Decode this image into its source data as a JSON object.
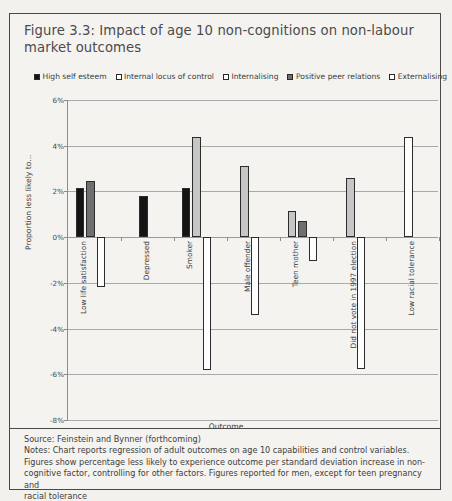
{
  "title": "Figure 3.3: Impact of age 10 non-cognitions on non-labour market outcomes",
  "legend": [
    {
      "label": "High self esteem",
      "color": "#141414",
      "swatch": "black-swatch"
    },
    {
      "label": "Internal locus of control",
      "color": "#ffffff",
      "swatch": "white-swatch"
    },
    {
      "label": "Internalising",
      "color": "#ffffff",
      "swatch": "white-swatch"
    },
    {
      "label": "Positive peer relations",
      "color": "#6f6f6f",
      "swatch": "gray-swatch"
    },
    {
      "label": "Externalising",
      "color": "#ffffff",
      "swatch": "white-swatch"
    }
  ],
  "footer": {
    "source": "Source: Feinstein and Bynner (forthcoming)",
    "notes_line1": "Notes: Chart reports regression of adult outcomes on age 10 capabilities and control variables.",
    "notes_line2": "Figures show percentage less likely to experience outcome per standard deviation increase in non-",
    "notes_line3": "cognitive factor, controlling for other factors. Figures reported for men, except for teen pregnancy and",
    "notes_line4": "racial tolerance"
  },
  "chart_data": {
    "type": "bar",
    "title": "Figure 3.3: Impact of age 10 non-cognitions on non-labour market outcomes",
    "xlabel": "Outcome",
    "ylabel": "Proportion less likely to...",
    "ylim": [
      -8,
      6
    ],
    "yticks": [
      6,
      4,
      2,
      0,
      -2,
      -4,
      -6,
      -8
    ],
    "ytick_labels": [
      "6%",
      "4%",
      "2%",
      "0%",
      "-2%",
      "-4%",
      "-6%",
      "-8%"
    ],
    "grid": true,
    "legend_position": "top",
    "categories": [
      "Low life satisfaction",
      "Depressed",
      "Smoker",
      "Male offender",
      "Teen mother",
      "Did not vote in 1997 election",
      "Low racial tolerance"
    ],
    "series": [
      {
        "name": "High self esteem",
        "color": "#141414",
        "values": [
          2.15,
          1.8,
          2.15,
          null,
          null,
          null,
          null
        ]
      },
      {
        "name": "Internal locus of control",
        "color": "#ffffff",
        "values": [
          null,
          null,
          null,
          null,
          null,
          null,
          null
        ]
      },
      {
        "name": "Internalising",
        "color": "#c6c6c6",
        "values": [
          null,
          null,
          4.4,
          3.1,
          1.15,
          2.6,
          null
        ]
      },
      {
        "name": "Positive peer relations",
        "color": "#6f6f6f",
        "values": [
          2.45,
          null,
          null,
          null,
          0.7,
          null,
          null
        ]
      },
      {
        "name": "Externalising",
        "color": "#ffffff",
        "values": [
          -2.2,
          null,
          -5.8,
          -3.4,
          -1.05,
          -5.75,
          4.4
        ]
      }
    ]
  }
}
